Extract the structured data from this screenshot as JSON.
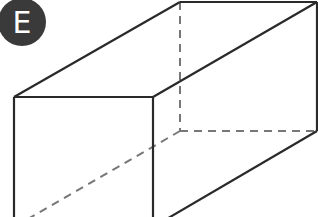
{
  "badge": {
    "label": "E",
    "bg_color": "#3a3a3a",
    "text_color": "#ffffff"
  },
  "figure": {
    "type": "rectangular prism (cuboid) line drawing with hidden edges dashed",
    "stroke_color": "#2a2a2a",
    "hidden_stroke_color": "#777777",
    "visible_edge_count": 7,
    "hidden_edge_count": 3
  }
}
